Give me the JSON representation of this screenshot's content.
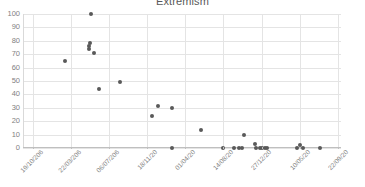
{
  "chart_data": {
    "type": "scatter",
    "title": "Extremism",
    "xlabel": "",
    "ylabel": "",
    "ylim": [
      0,
      100
    ],
    "yticks": [
      0,
      10,
      20,
      30,
      40,
      50,
      60,
      70,
      80,
      90,
      100
    ],
    "grid": true,
    "legend": false,
    "marker_color": "#595959",
    "gridline_color": "#e4e4e4",
    "axis_color": "#bfbfbf",
    "tick_label_color": "#7f7f7f",
    "xticks": [
      "19/10/206",
      "22/03/206",
      "06/07/206",
      "18/11/20",
      "01/04/20",
      "14/08/20",
      "27/12/20",
      "10/05/20",
      "22/09/20"
    ],
    "xtick_positions_pct": [
      3,
      15,
      27,
      39,
      51,
      63,
      75,
      87,
      99
    ],
    "points": [
      {
        "x_pct": 13.2,
        "y": 65
      },
      {
        "x_pct": 21.5,
        "y": 100
      },
      {
        "x_pct": 21.0,
        "y": 78
      },
      {
        "x_pct": 20.8,
        "y": 76
      },
      {
        "x_pct": 20.6,
        "y": 74
      },
      {
        "x_pct": 22.3,
        "y": 71
      },
      {
        "x_pct": 24.0,
        "y": 44
      },
      {
        "x_pct": 30.5,
        "y": 49
      },
      {
        "x_pct": 40.6,
        "y": 24
      },
      {
        "x_pct": 42.5,
        "y": 31
      },
      {
        "x_pct": 47.0,
        "y": 30
      },
      {
        "x_pct": 47.0,
        "y": 0
      },
      {
        "x_pct": 56.0,
        "y": 13.5
      },
      {
        "x_pct": 63.0,
        "y": 0
      },
      {
        "x_pct": 66.5,
        "y": 0
      },
      {
        "x_pct": 68.0,
        "y": 0
      },
      {
        "x_pct": 68.8,
        "y": 0
      },
      {
        "x_pct": 69.5,
        "y": 10
      },
      {
        "x_pct": 73.0,
        "y": 3
      },
      {
        "x_pct": 73.4,
        "y": 0
      },
      {
        "x_pct": 74.4,
        "y": 0
      },
      {
        "x_pct": 75.2,
        "y": 0
      },
      {
        "x_pct": 76.0,
        "y": 0
      },
      {
        "x_pct": 76.8,
        "y": 0
      },
      {
        "x_pct": 86.3,
        "y": 0
      },
      {
        "x_pct": 87.0,
        "y": 2
      },
      {
        "x_pct": 88.0,
        "y": 0
      },
      {
        "x_pct": 93.5,
        "y": 0
      }
    ]
  }
}
